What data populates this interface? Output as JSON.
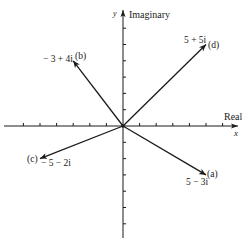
{
  "diagram": {
    "axes": {
      "x": {
        "name": "Real",
        "variable": "x",
        "ticks_negative": 6,
        "ticks_positive": 6
      },
      "y": {
        "name": "Imaginary",
        "variable": "y",
        "ticks_positive": 6,
        "ticks_negative": 6
      }
    },
    "origin_px": [
      123,
      126
    ],
    "unit_px": {
      "x": 16.6,
      "y": 16.3
    },
    "colors": {
      "ink": "#1a1a1a",
      "background": "#ffffff"
    },
    "vectors": [
      {
        "id": "a",
        "tag": "(a)",
        "expr": "5 − 3i",
        "re": 5,
        "im": -3
      },
      {
        "id": "b",
        "tag": "(b)",
        "expr": "− 3 + 4i",
        "re": -3,
        "im": 4
      },
      {
        "id": "c",
        "tag": "(c)",
        "expr": "− 5 − 2i",
        "re": -5,
        "im": -2
      },
      {
        "id": "d",
        "tag": "(d)",
        "expr": "5 + 5i",
        "re": 5,
        "im": 5
      }
    ]
  }
}
